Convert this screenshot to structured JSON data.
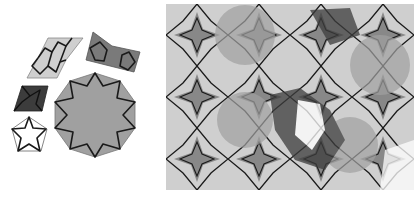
{
  "figure": {
    "left_panel": {
      "description": "Set of five girih tiles",
      "tiles": [
        {
          "name": "elongated-hexagon",
          "fill": "#cfcfcf"
        },
        {
          "name": "bowtie",
          "fill": "#7a7a7a"
        },
        {
          "name": "rhombus",
          "fill": "#3c3c3c"
        },
        {
          "name": "pentagon",
          "fill": "#ffffff"
        },
        {
          "name": "decagon",
          "fill": "#a0a0a0"
        }
      ]
    },
    "right_panel": {
      "description": "Girih tiling pattern with decagonal rosettes"
    },
    "colors": {
      "line": "#1a1a1a",
      "light": "#cfcfcf",
      "medium": "#a0a0a0",
      "dark": "#3c3c3c",
      "bowtie": "#7a7a7a"
    }
  }
}
